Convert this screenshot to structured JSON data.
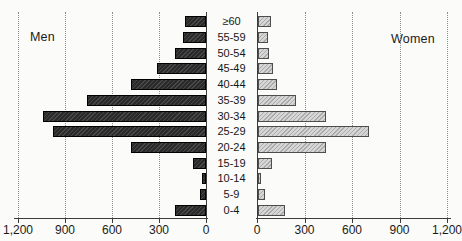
{
  "chart_data": {
    "type": "bar",
    "variant": "population-pyramid",
    "title": "",
    "categories": [
      "≥60",
      "55-59",
      "50-54",
      "45-49",
      "40-44",
      "35-39",
      "30-34",
      "25-29",
      "20-24",
      "15-19",
      "10-14",
      "5-9",
      "0-4"
    ],
    "series": [
      {
        "name": "Men",
        "side": "left",
        "values": [
          135,
          145,
          200,
          310,
          480,
          760,
          1040,
          975,
          480,
          80,
          25,
          40,
          200
        ]
      },
      {
        "name": "Women",
        "side": "right",
        "values": [
          80,
          65,
          70,
          95,
          120,
          240,
          430,
          700,
          430,
          90,
          20,
          45,
          170
        ]
      }
    ],
    "x_axis": {
      "max": 1200,
      "tick_interval": 300,
      "left_tick_labels": [
        "1,200",
        "900",
        "600",
        "300",
        "0"
      ],
      "right_tick_labels": [
        "0",
        "300",
        "600",
        "900",
        "1,200"
      ],
      "gridlines": "dotted-vertical"
    },
    "ylabel": "",
    "xlabel": "",
    "legend_position": "inside-plot-top",
    "colors": {
      "men_bar_fill": "#2a2a2a",
      "women_bar_fill": "#cdcdcd",
      "gridline": "#8c8c8c",
      "axis": "#3c3c3c",
      "text": "#1a1a1a",
      "background": "#fbfbf9"
    }
  }
}
